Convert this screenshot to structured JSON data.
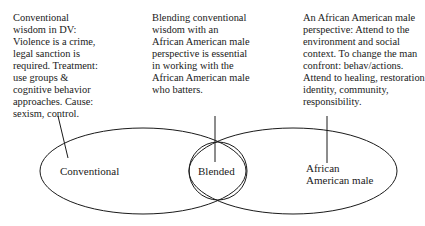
{
  "diagram": {
    "type": "venn",
    "notes": {
      "conventional": "Conventional\nwisdom in DV:\nViolence is a crime,\nlegal sanction is\nrequired. Treatment:\nuse groups &\ncognitive behavior\napproaches. Cause:\nsexism, control.",
      "blended": "Blending conventional\nwisdom with an\nAfrican American male\nperspective is essential\nin working with the\nAfrican American male\nwho batters.",
      "african_american_male": "An African American male\nperspective: Attend to the\nenvironment and social\ncontext. To change the man\nconfront: behav/actions.\nAttend to healing, restoration\nidentity, community,\nresponsibility."
    },
    "labels": {
      "conventional": "Conventional",
      "blended": "Blended",
      "african_american_male": "African\nAmerican male"
    },
    "stroke_color": "#1a1a1a",
    "background": "#ffffff"
  }
}
